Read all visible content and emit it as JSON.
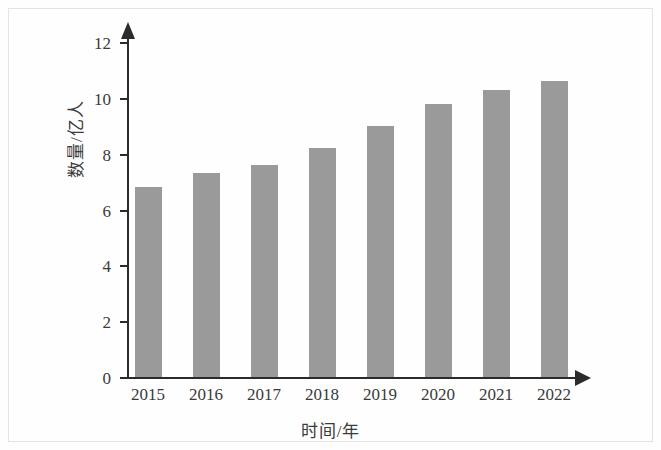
{
  "chart_data": {
    "type": "bar",
    "title": "",
    "xlabel": "时间/年",
    "ylabel": "数量/亿人",
    "categories": [
      "2015",
      "2016",
      "2017",
      "2018",
      "2019",
      "2020",
      "2021",
      "2022"
    ],
    "values": [
      6.8,
      7.3,
      7.6,
      8.2,
      9.0,
      9.8,
      10.3,
      10.6
    ],
    "series": [
      {
        "name": "数量/亿人",
        "values": [
          6.8,
          7.3,
          7.6,
          8.2,
          9.0,
          9.8,
          10.3,
          10.6
        ]
      }
    ],
    "ylim": [
      0,
      12.6
    ],
    "yticks": [
      "0",
      "2",
      "4",
      "6",
      "8",
      "10",
      "12"
    ],
    "ytick_values": [
      0,
      2,
      4,
      6,
      8,
      10,
      12
    ],
    "grid": false,
    "legend": "none",
    "bar_color": "#9a9a9a",
    "axis_color": "#2b2b2b"
  },
  "axes": {
    "y_title": "数量/亿人",
    "x_title": "时间/年"
  }
}
